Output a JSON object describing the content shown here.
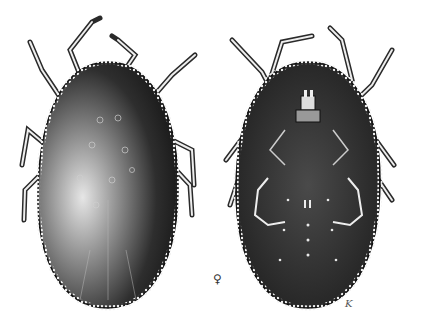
{
  "figure": {
    "views": [
      {
        "id": "dorsal",
        "label": "dorsal view"
      },
      {
        "id": "ventral",
        "label": "ventral view"
      }
    ],
    "sex_symbol": "♀",
    "artist_mark": "K"
  },
  "colors": {
    "ink": "#1c1c1c",
    "body_mid": "#3a3a3a",
    "highlight": "#d8d8d8",
    "paper": "#ffffff"
  }
}
